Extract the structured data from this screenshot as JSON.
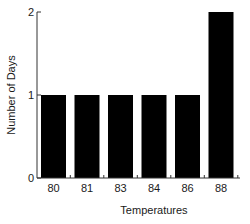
{
  "chart_data": {
    "type": "bar",
    "title": "",
    "xlabel": "Temperatures",
    "ylabel": "Number of Days",
    "categories": [
      "80",
      "81",
      "83",
      "84",
      "86",
      "88"
    ],
    "values": [
      1,
      1,
      1,
      1,
      1,
      2
    ],
    "ylim": [
      0,
      2
    ],
    "yticks": [
      0,
      1,
      2
    ],
    "grid": false,
    "legend": null,
    "bar_color": "#000000"
  }
}
